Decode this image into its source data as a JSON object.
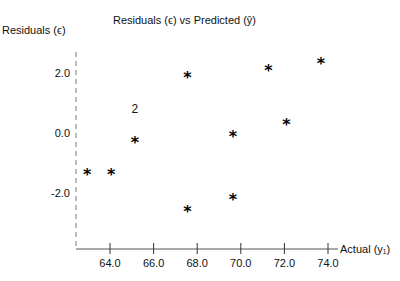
{
  "chart_data": {
    "type": "scatter",
    "title": "Residuals (ϵ) vs Predicted (ŷ)",
    "xlabel": "Actual (y₁)",
    "ylabel": "Residuals (ϵ)",
    "xlim": [
      62.5,
      74.5
    ],
    "ylim": [
      -3.9,
      2.7
    ],
    "x_ticks": [
      64.0,
      66.0,
      68.0,
      70.0,
      72.0,
      74.0
    ],
    "x_tick_labels": [
      "64.0",
      "66.0",
      "68.0",
      "70.0",
      "72.0",
      "74.0"
    ],
    "y_ticks": [
      2.0,
      0.0,
      -2.0
    ],
    "y_tick_labels": [
      "2.0",
      "0.0",
      "-2.0"
    ],
    "grid": false,
    "marker": "*",
    "points": [
      {
        "x": 62.95,
        "y": -1.27
      },
      {
        "x": 64.05,
        "y": -1.27
      },
      {
        "x": 65.14,
        "y": -0.2,
        "count": 2,
        "annotation": "2"
      },
      {
        "x": 67.55,
        "y": 1.97
      },
      {
        "x": 67.55,
        "y": -2.5
      },
      {
        "x": 69.64,
        "y": 0.0
      },
      {
        "x": 69.64,
        "y": -2.1
      },
      {
        "x": 71.27,
        "y": 2.2
      },
      {
        "x": 72.09,
        "y": 0.4
      },
      {
        "x": 73.68,
        "y": 2.43
      }
    ],
    "annotations": [
      {
        "text": "2",
        "x": 65.14,
        "y": 0.8,
        "meaning": "two overlapping points"
      }
    ]
  },
  "layout": {
    "plot_px": {
      "x_origin_value": 64.0,
      "x_origin_px": 110,
      "x_px_per_unit": 21.8,
      "y_origin_value": 0.0,
      "y_origin_px": 133,
      "y_px_per_unit": 30,
      "y_axis_px": 76,
      "x_axis_px": 249,
      "y_axis_top_px": 52,
      "x_axis_right_px": 338
    }
  }
}
